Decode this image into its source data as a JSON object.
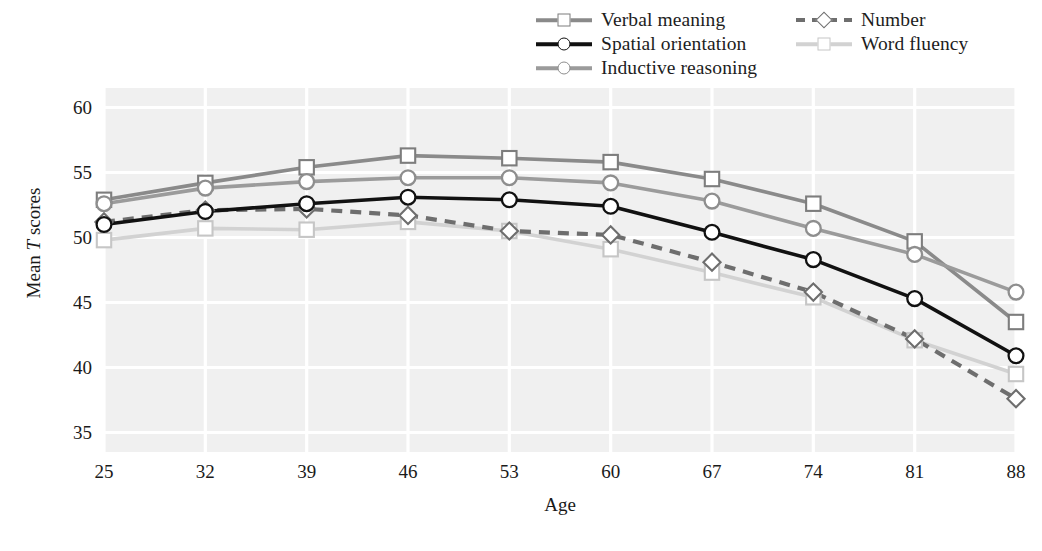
{
  "chart_data": {
    "type": "line",
    "title": "",
    "xlabel": "Age",
    "ylabel": "Mean T scores",
    "ylabel_plain": "Mean T scores",
    "x": [
      25,
      32,
      39,
      46,
      53,
      60,
      67,
      74,
      81,
      88
    ],
    "categories": [
      "25",
      "32",
      "39",
      "46",
      "53",
      "60",
      "67",
      "74",
      "81",
      "88"
    ],
    "xlim": [
      25,
      88
    ],
    "ylim": [
      33.5,
      61.5
    ],
    "yticks": [
      60,
      55,
      50,
      45,
      40,
      35
    ],
    "ytick_labels": [
      "60",
      "55",
      "50",
      "45",
      "40",
      "35"
    ],
    "grid": "both",
    "legend_position": "top-right",
    "series": [
      {
        "name": "Verbal meaning",
        "color": "#8a8a8a",
        "marker": "square",
        "dash": "solid",
        "values": [
          52.9,
          54.2,
          55.4,
          56.3,
          56.1,
          55.8,
          54.5,
          52.6,
          49.7,
          43.5
        ]
      },
      {
        "name": "Spatial orientation",
        "color": "#111111",
        "marker": "circle",
        "dash": "solid",
        "values": [
          51.0,
          52.0,
          52.6,
          53.1,
          52.9,
          52.4,
          50.4,
          48.3,
          45.3,
          40.9
        ]
      },
      {
        "name": "Inductive reasoning",
        "color": "#9b9b9b",
        "marker": "circle",
        "dash": "solid",
        "values": [
          52.6,
          53.8,
          54.3,
          54.6,
          54.6,
          54.2,
          52.8,
          50.7,
          48.7,
          45.8
        ]
      },
      {
        "name": "Number",
        "color": "#6e6e6e",
        "marker": "diamond",
        "dash": "dashed",
        "values": [
          51.2,
          52.1,
          52.2,
          51.7,
          50.5,
          50.2,
          48.1,
          45.8,
          42.2,
          37.6
        ]
      },
      {
        "name": "Word fluency",
        "color": "#d2d2d2",
        "marker": "square",
        "dash": "solid",
        "values": [
          49.8,
          50.7,
          50.6,
          51.2,
          50.5,
          49.1,
          47.3,
          45.4,
          42.1,
          39.5
        ]
      }
    ]
  },
  "legend": {
    "items": [
      {
        "label": "Verbal meaning",
        "marker": "square-marker",
        "color": "#8a8a8a",
        "dash": "solid"
      },
      {
        "label": "Spatial orientation",
        "marker": "circle-marker",
        "color": "#111111",
        "dash": "solid"
      },
      {
        "label": "Inductive reasoning",
        "marker": "circle-marker",
        "color": "#9b9b9b",
        "dash": "solid"
      },
      {
        "label": "Number",
        "marker": "diamond-marker",
        "color": "#6e6e6e",
        "dash": "dashed"
      },
      {
        "label": "Word fluency",
        "marker": "square-marker",
        "color": "#d2d2d2",
        "dash": "solid"
      }
    ]
  },
  "axes": {
    "y_label_prefix": "Mean ",
    "y_label_italic": "T",
    "y_label_suffix": " scores",
    "x_label": "Age"
  },
  "style": {
    "plot_background": "#f0f0f0",
    "gridline_color": "#ffffff",
    "page_background": "#ffffff",
    "text_color": "#1a1a1a"
  }
}
